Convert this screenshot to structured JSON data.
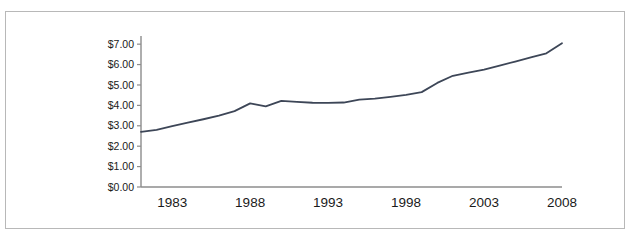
{
  "figure": {
    "clipped_caption_text": "",
    "background_color": "#ffffff",
    "frame_color": "#b8b8b8"
  },
  "chart_data": {
    "type": "line",
    "title": "",
    "subtitle": "",
    "xlabel": "",
    "ylabel": "",
    "xlim": [
      1981,
      2008
    ],
    "ylim": [
      0,
      7.4
    ],
    "grid": false,
    "legend": null,
    "legend_position": "none",
    "line_color": "#3d4657",
    "line_width": 1.8,
    "axis_color": "#8c8c8c",
    "y_tick_labels": [
      "$0.00",
      "$1.00",
      "$2.00",
      "$3.00",
      "$4.00",
      "$5.00",
      "$6.00",
      "$7.00"
    ],
    "y_tick_values": [
      0,
      1,
      2,
      3,
      4,
      5,
      6,
      7
    ],
    "x_tick_labels": [
      "1983",
      "1988",
      "1993",
      "1998",
      "2003",
      "2008"
    ],
    "x_tick_values": [
      1983,
      1988,
      1993,
      1998,
      2003,
      2008
    ],
    "x": [
      1981,
      1982,
      1983,
      1984,
      1985,
      1986,
      1987,
      1988,
      1989,
      1990,
      1991,
      1992,
      1993,
      1994,
      1995,
      1996,
      1997,
      1998,
      1999,
      2000,
      2001,
      2002,
      2003,
      2004,
      2005,
      2006,
      2007,
      2008
    ],
    "values": [
      2.7,
      2.8,
      2.98,
      3.15,
      3.32,
      3.5,
      3.72,
      4.1,
      3.95,
      4.22,
      4.17,
      4.13,
      4.12,
      4.14,
      4.28,
      4.33,
      4.42,
      4.52,
      4.65,
      5.1,
      5.45,
      5.6,
      5.75,
      5.95,
      6.15,
      6.35,
      6.55,
      7.05
    ],
    "series": [
      {
        "name": "value",
        "values": [
          2.7,
          2.8,
          2.98,
          3.15,
          3.32,
          3.5,
          3.72,
          4.1,
          3.95,
          4.22,
          4.17,
          4.13,
          4.12,
          4.14,
          4.28,
          4.33,
          4.42,
          4.52,
          4.65,
          5.1,
          5.45,
          5.6,
          5.75,
          5.95,
          6.15,
          6.35,
          6.55,
          7.05
        ]
      }
    ]
  }
}
